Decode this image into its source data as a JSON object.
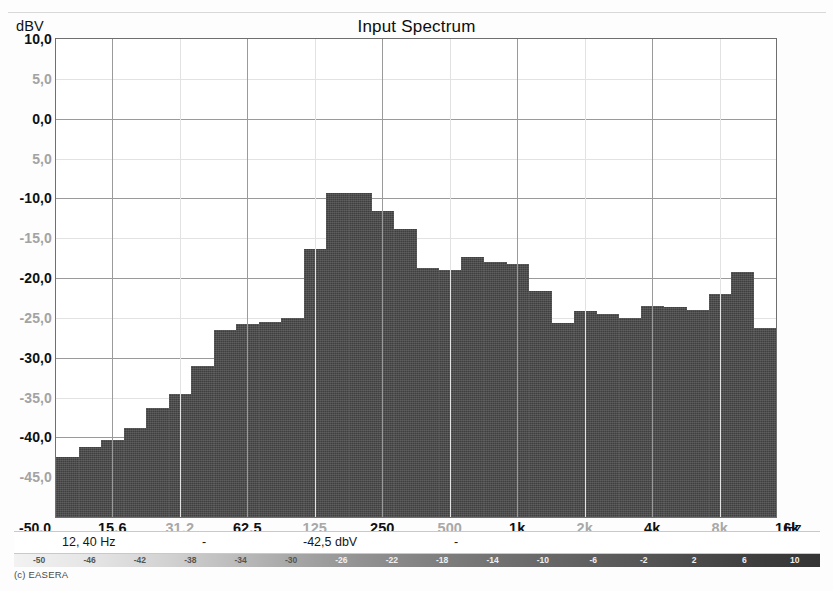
{
  "chart": {
    "title": "Input Spectrum",
    "y_unit": "dBV",
    "x_unit": "Hz"
  },
  "readout": {
    "frequency": "12, 40 Hz",
    "separator_1": "-",
    "level": "-42,5 dbV",
    "separator_2": "-"
  },
  "credit": "(c) EASERA",
  "scalebar": {
    "ticks": [
      "-50",
      "-46",
      "-42",
      "-38",
      "-34",
      "-30",
      "-26",
      "-22",
      "-18",
      "-14",
      "-10",
      "-6",
      "-2",
      "2",
      "6",
      "10"
    ]
  },
  "chart_data": {
    "type": "bar",
    "title": "Input Spectrum",
    "xlabel": "Hz",
    "ylabel": "dBV",
    "ylim": [
      -50.0,
      10.0
    ],
    "grid": true,
    "legend": null,
    "y_ticks_major": [
      "10,0",
      "0,0",
      "-10,0",
      "-20,0",
      "-30,0",
      "-40,0",
      "-50,0"
    ],
    "y_ticks_minor": [
      "5,0",
      "5,0",
      "-15,0",
      "-25,0",
      "-35,0",
      "-45,0"
    ],
    "y_tick_values": [
      10.0,
      5.0,
      0.0,
      -5.0,
      -10.0,
      -15.0,
      -20.0,
      -25.0,
      -30.0,
      -35.0,
      -40.0,
      -45.0,
      -50.0
    ],
    "x_tick_labels": [
      "15,6",
      "31,2",
      "62,5",
      "125",
      "250",
      "500",
      "1k",
      "2k",
      "4k",
      "8k",
      "16k"
    ],
    "x_tick_major": [
      "15,6",
      "62,5",
      "250",
      "1k",
      "4k",
      "16k"
    ],
    "x_tick_minor": [
      "31,2",
      "125",
      "500",
      "2k",
      "8k"
    ],
    "categories": [
      "12,5",
      "16",
      "20",
      "25",
      "31,5",
      "40",
      "50",
      "63",
      "80",
      "100",
      "125",
      "160",
      "200",
      "250",
      "315",
      "400",
      "500",
      "630",
      "800",
      "1k",
      "1,25k",
      "1,6k",
      "2k",
      "2,5k",
      "3,15k",
      "4k",
      "5k",
      "6,3k",
      "8k",
      "10k",
      "12,5k",
      "16k"
    ],
    "values": [
      -42.5,
      -41.2,
      -40.3,
      -38.8,
      -36.3,
      -34.5,
      -31.0,
      -26.5,
      -25.8,
      -25.5,
      -25.0,
      -16.3,
      -9.3,
      -9.3,
      -11.6,
      -13.8,
      -18.7,
      -19.0,
      -17.3,
      -18.0,
      -18.3,
      -21.6,
      -25.6,
      -24.2,
      -24.5,
      -25.0,
      -23.5,
      -23.6,
      -24.0,
      -22.0,
      -19.3,
      -26.3
    ]
  }
}
